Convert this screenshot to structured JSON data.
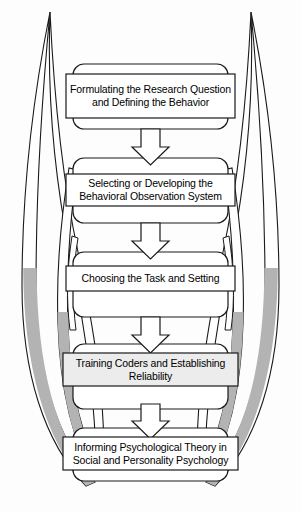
{
  "figure": {
    "background_color": "#fdfdfd",
    "line_color": "#1a1a1a",
    "ornament_fill_gray": "#b3b3b3",
    "ornament_fill_white": "#ffffff",
    "box_fill_white": "#ffffff",
    "box_fill_tinted": "#ececec"
  },
  "flow": {
    "orientation": "vertical-top-to-bottom",
    "stage_count": 5,
    "connector_count": 4,
    "connector_icon": "down-arrow-icon",
    "stages": [
      {
        "index": 1,
        "text": "Formulating the Research Question and Defining the Behavior",
        "lines": [
          "Formulating the Research",
          "Question and Defining the",
          "Behavior"
        ],
        "fill": "#ffffff"
      },
      {
        "index": 2,
        "text": "Selecting or Developing the Behavioral Observation System",
        "lines": [
          "Selecting or Developing the",
          "Behavioral Observation System"
        ],
        "fill": "#ffffff"
      },
      {
        "index": 3,
        "text": "Choosing the Task and Setting",
        "lines": [
          "Choosing the Task and Setting"
        ],
        "fill": "#ffffff"
      },
      {
        "index": 4,
        "text": "Training Coders and Establishing Reliability",
        "lines": [
          "Training Coders and Establishing",
          "Reliability"
        ],
        "fill": "#ececec"
      },
      {
        "index": 5,
        "text": "Informing Psychological Theory in Social and Personality Psychology",
        "lines": [
          "Informing Psychological Theory in",
          "Social and Personality Psychology"
        ],
        "fill": "#ffffff"
      }
    ]
  },
  "ornaments": {
    "description": "Mirrored decorative feather-like curved blades flanking the flowchart on the left and right sides",
    "left_count": 3,
    "right_count": 3,
    "shaded_region": "lower"
  }
}
